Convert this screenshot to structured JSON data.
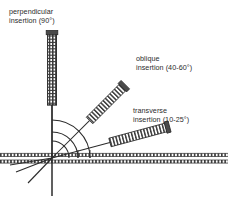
{
  "figure": {
    "background_color": "#ffffff",
    "ink_color": "#2b2b2b",
    "width": 230,
    "height": 201
  },
  "labels": {
    "perpendicular": {
      "line1": "perpendicular",
      "line2": "insertion (90°)",
      "angle_text": "90°"
    },
    "oblique": {
      "line1": "oblique",
      "line2": "insertion (40-60°)",
      "angle_text": "40-60°"
    },
    "transverse": {
      "line1": "transverse",
      "line2": "insertion (10-25°)",
      "angle_text": "10-25°"
    }
  },
  "needles": [
    {
      "name": "perpendicular-needle",
      "angle_deg": 90,
      "handle_texture": "ribbed"
    },
    {
      "name": "oblique-needle",
      "angle_deg": 45,
      "handle_texture": "ribbed"
    },
    {
      "name": "transverse-needle",
      "angle_deg": 15,
      "handle_texture": "ribbed"
    }
  ],
  "skin": {
    "layer_count": 2,
    "texture": "hatched"
  },
  "arcs": {
    "count": 3
  }
}
